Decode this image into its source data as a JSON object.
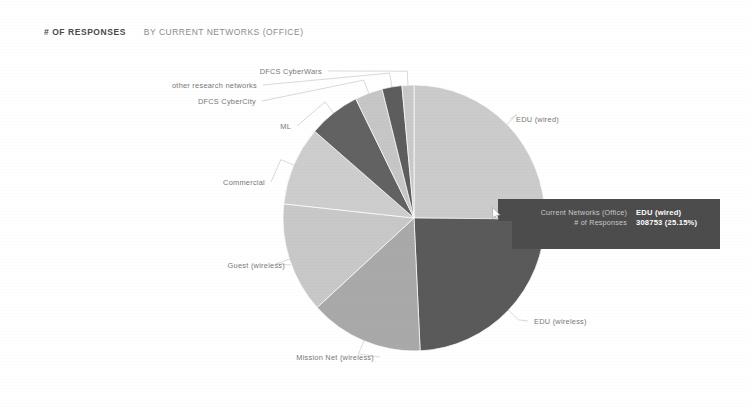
{
  "header": {
    "metric": "# OF RESPONSES",
    "dimension": "BY CURRENT NETWORKS (OFFICE)"
  },
  "tooltip": {
    "dimension_key": "Current Networks (Office)",
    "dimension_value": "EDU (wired)",
    "metric_key": "# of Responses",
    "metric_value": "308753 (25.15%)"
  },
  "colors": {
    "background": "#ffffff",
    "tooltip_bg": "#4c4c4c",
    "label_text": "#777777",
    "slice_light": "#cfcfcf",
    "slice_mid": "#a8a8a8",
    "slice_dark": "#5f5f5f"
  },
  "chart_data": {
    "type": "pie",
    "title": "# OF RESPONSES BY CURRENT NETWORKS (OFFICE)",
    "xlabel": "Current Networks (Office)",
    "ylabel": "# of Responses",
    "legend_position": "labels-with-leader-lines",
    "grid": false,
    "total": 1227487,
    "categories": [
      "EDU (wired)",
      "EDU (wireless)",
      "Mission Net (wireless)",
      "Guest (wireless)",
      "Commercial",
      "ML",
      "DFCS CyberCity",
      "other research networks",
      "DFCS CyberWars"
    ],
    "values": [
      308753,
      296000,
      172000,
      165000,
      118000,
      78000,
      42000,
      30000,
      17734
    ],
    "percentages": [
      25.15,
      24.12,
      14.01,
      13.44,
      9.61,
      6.35,
      3.42,
      2.44,
      1.46
    ],
    "slices": [
      {
        "label": "EDU (wired)",
        "value": 308753,
        "percent": 25.15,
        "color": "#cbcbcb",
        "start_angle": 0.0,
        "end_angle": 90.5,
        "label_side": "right",
        "label_x": 516,
        "label_y": 116
      },
      {
        "label": "EDU (wireless)",
        "value": 296000,
        "percent": 24.12,
        "color": "#5a5a5a",
        "start_angle": 90.5,
        "end_angle": 177.3,
        "label_side": "right",
        "label_x": 534,
        "label_y": 318
      },
      {
        "label": "Mission Net (wireless)",
        "value": 172000,
        "percent": 14.01,
        "color": "#a9a9a9",
        "start_angle": 177.3,
        "end_angle": 227.7,
        "label_side": "left",
        "label_x": 374,
        "label_y": 354
      },
      {
        "label": "Guest (wireless)",
        "value": 165000,
        "percent": 13.44,
        "color": "#c8c8c8",
        "start_angle": 227.7,
        "end_angle": 276.1,
        "label_side": "left",
        "label_x": 285,
        "label_y": 262
      },
      {
        "label": "Commercial",
        "value": 118000,
        "percent": 9.61,
        "color": "#cdcdcd",
        "start_angle": 276.1,
        "end_angle": 310.7,
        "label_side": "left",
        "label_x": 265,
        "label_y": 179
      },
      {
        "label": "ML",
        "value": 78000,
        "percent": 6.35,
        "color": "#626262",
        "start_angle": 310.7,
        "end_angle": 333.6,
        "label_side": "left",
        "label_x": 291,
        "label_y": 123
      },
      {
        "label": "DFCS CyberCity",
        "value": 42000,
        "percent": 3.42,
        "color": "#c6c6c6",
        "start_angle": 333.6,
        "end_angle": 345.9,
        "label_side": "left",
        "label_x": 256,
        "label_y": 98
      },
      {
        "label": "other research networks",
        "value": 30000,
        "percent": 2.44,
        "color": "#5d5d5d",
        "start_angle": 345.9,
        "end_angle": 354.7,
        "label_side": "left",
        "label_x": 257,
        "label_y": 82
      },
      {
        "label": "DFCS CyberWars",
        "value": 17734,
        "percent": 1.46,
        "color": "#c9c9c9",
        "start_angle": 354.7,
        "end_angle": 360.0,
        "label_side": "left",
        "label_x": 322,
        "label_y": 68
      }
    ],
    "geometry": {
      "cx": 414,
      "cy": 218,
      "rx": 131,
      "ry": 133
    }
  }
}
